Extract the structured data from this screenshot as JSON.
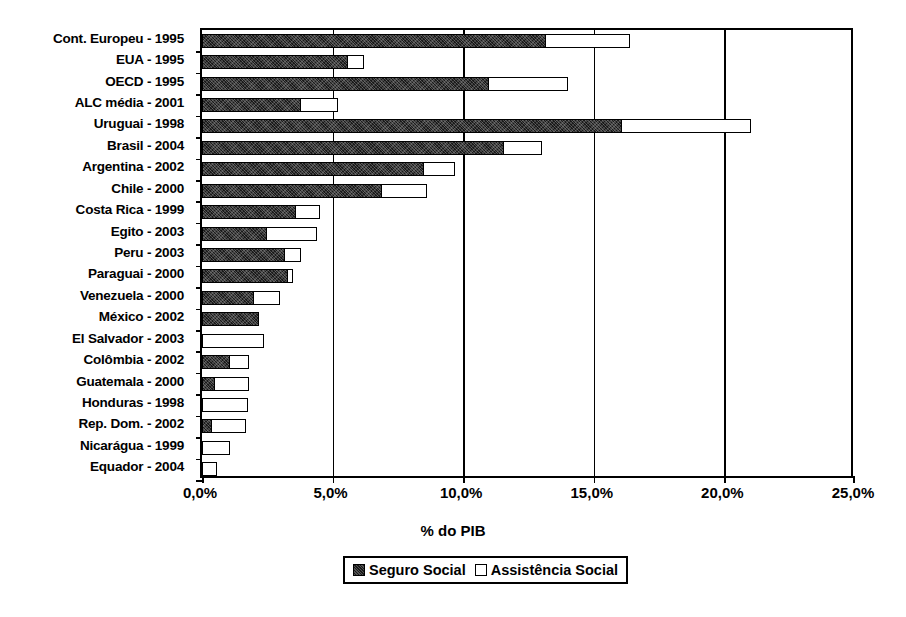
{
  "chart_data": {
    "type": "bar",
    "orientation": "horizontal",
    "stacked": true,
    "title": "",
    "xlabel": "% do PIB",
    "ylabel": "",
    "xlim": [
      0,
      25
    ],
    "xticks": [
      0,
      5,
      10,
      15,
      20,
      25
    ],
    "xtick_labels": [
      "0,0%",
      "5,0%",
      "10,0%",
      "15,0%",
      "20,0%",
      "25,0%"
    ],
    "grid": true,
    "legend_position": "bottom",
    "categories": [
      "Cont. Europeu - 1995",
      "EUA - 1995",
      "OECD - 1995",
      "ALC média - 2001",
      "Uruguai - 1998",
      "Brasil - 2004",
      "Argentina - 2002",
      "Chile - 2000",
      "Costa Rica - 1999",
      "Egito - 2003",
      "Peru - 2003",
      "Paraguai - 2000",
      "Venezuela - 2000",
      "México - 2002",
      "El Salvador - 2003",
      "Colômbia - 2002",
      "Guatemala - 2000",
      "Honduras - 1998",
      "Rep. Dom. - 2002",
      "Nicarágua - 1999",
      "Equador - 2004"
    ],
    "series": [
      {
        "name": "Seguro Social",
        "color": "#1a1a1a",
        "values": [
          13.2,
          5.6,
          11.0,
          3.8,
          16.1,
          11.6,
          8.5,
          6.9,
          3.6,
          2.5,
          3.2,
          3.3,
          2.0,
          2.2,
          0.0,
          1.1,
          0.5,
          0.0,
          0.4,
          0.0,
          0.0
        ]
      },
      {
        "name": "Assistência Social",
        "color": "#ffffff",
        "values": [
          3.2,
          0.6,
          3.0,
          1.4,
          4.9,
          1.4,
          1.2,
          1.7,
          0.9,
          1.9,
          0.6,
          0.2,
          1.0,
          0.0,
          2.3,
          0.7,
          1.3,
          1.7,
          1.3,
          1.0,
          0.5
        ]
      }
    ],
    "totals": [
      16.4,
      6.2,
      14.0,
      5.2,
      21.0,
      13.0,
      9.7,
      8.6,
      4.5,
      4.4,
      3.8,
      3.5,
      3.0,
      2.2,
      2.3,
      1.8,
      1.8,
      1.7,
      1.7,
      1.0,
      0.5
    ]
  },
  "axis": {
    "x_title": "% do PIB",
    "tick_labels": [
      "0,0%",
      "5,0%",
      "10,0%",
      "15,0%",
      "20,0%",
      "25,0%"
    ]
  },
  "legend": {
    "items": [
      {
        "label": "Seguro Social",
        "swatch": "filled-black-swatch"
      },
      {
        "label": "Assistência Social",
        "swatch": "empty-white-swatch"
      }
    ]
  }
}
